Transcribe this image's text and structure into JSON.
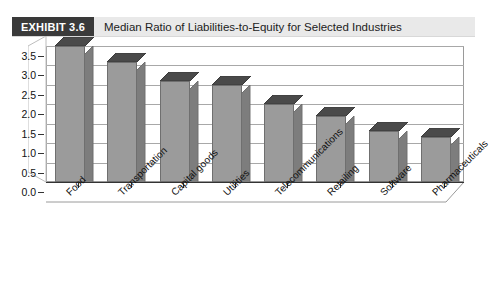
{
  "header": {
    "badge": "EXHIBIT 3.6",
    "title": "Median Ratio of Liabilities-to-Equity for Selected Industries"
  },
  "colors": {
    "badge_bg": "#3a3a3a",
    "header_bg": "#e9e9e9",
    "bar_face": "#9b9b9b",
    "bar_top": "#4a4a4a",
    "bar_side": "#7d7d7d",
    "grid": "#a8a8a8",
    "frame": "#9a9a9a",
    "axis": "#333333"
  },
  "chart_data": {
    "type": "bar",
    "title": "Median Ratio of Liabilities-to-Equity for Selected Industries",
    "xlabel": "",
    "ylabel": "",
    "ylim": [
      0.0,
      3.5
    ],
    "ytick_labels": [
      "3.5",
      "3.0",
      "2.5",
      "2.0",
      "1.5",
      "1.0",
      "0.5",
      "0.0"
    ],
    "ytick_values": [
      3.5,
      3.0,
      2.5,
      2.0,
      1.5,
      1.0,
      0.5,
      0.0
    ],
    "grid": true,
    "legend": "none",
    "style": "3d-column",
    "categories": [
      "Food",
      "Transportation",
      "Capital goods",
      "Utilities",
      "Telecommunications",
      "Retailing",
      "Software",
      "Pharmaceuticals"
    ],
    "values": [
      3.5,
      3.1,
      2.6,
      2.5,
      2.0,
      1.7,
      1.3,
      1.15
    ]
  }
}
